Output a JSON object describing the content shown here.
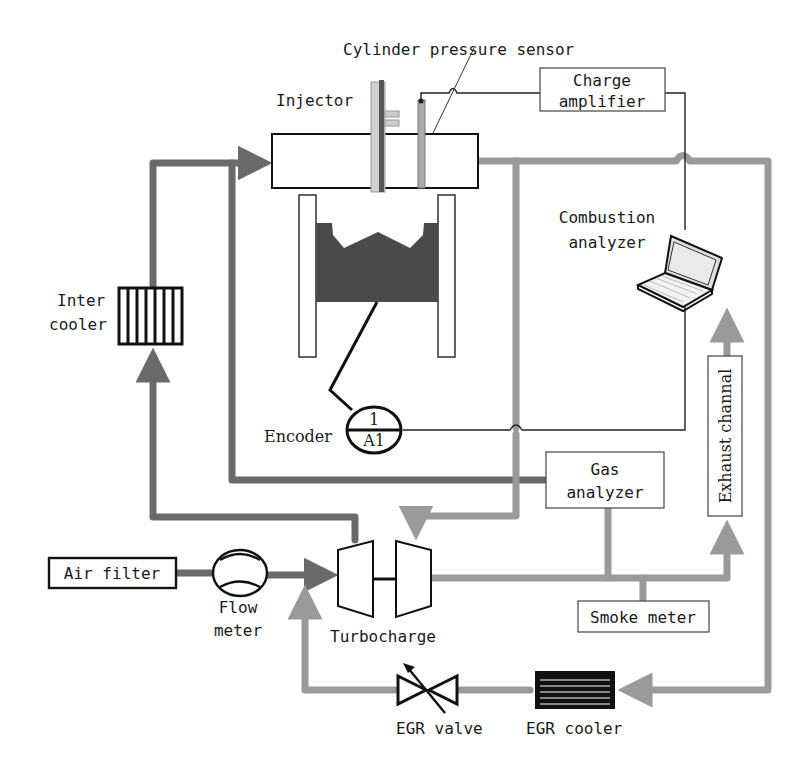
{
  "diagram": {
    "colors": {
      "pipe_intake": "#6a6a6a",
      "pipe_exhaust": "#9a9a9a",
      "piston": "#4a4a4a",
      "line": "#222222"
    },
    "components": {
      "cylinder_pressure_sensor": "Cylinder pressure sensor",
      "injector": "Injector",
      "charge_amplifier": {
        "line1": "Charge",
        "line2": "amplifier"
      },
      "combustion_analyzer": {
        "line1": "Combustion",
        "line2": "analyzer"
      },
      "inter_cooler": {
        "line1": "Inter",
        "line2": "cooler"
      },
      "encoder": "Encoder",
      "encoder_top": "1",
      "encoder_bottom": "A1",
      "gas_analyzer": {
        "line1": "Gas",
        "line2": "analyzer"
      },
      "exhaust_channel": "Exhaust channal",
      "air_filter": "Air filter",
      "flow_meter": {
        "line1": "Flow",
        "line2": "meter"
      },
      "turbocharger": "Turbocharge",
      "smoke_meter": "Smoke meter",
      "egr_valve": "EGR valve",
      "egr_cooler": "EGR cooler"
    }
  }
}
